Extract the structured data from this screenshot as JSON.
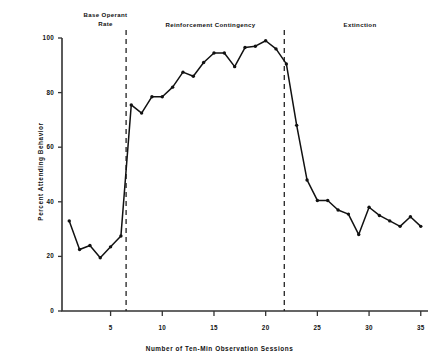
{
  "figure": {
    "background_color": "#ffffff",
    "line_color": "#111111",
    "marker_color": "#111111",
    "axis_color": "#333333"
  },
  "axes": {
    "x": {
      "title": "Number of Ten-Min Observation Sessions",
      "ticks": [
        5,
        10,
        15,
        20,
        25,
        30,
        35
      ],
      "tick_labels": [
        "5",
        "10",
        "15",
        "20",
        "25",
        "30",
        "35"
      ],
      "min": 0.3,
      "max": 35.7
    },
    "y": {
      "title": "Percent Attending Behavior",
      "ticks": [
        0,
        20,
        40,
        60,
        80,
        100
      ],
      "tick_labels": [
        "0",
        "20",
        "40",
        "60",
        "80",
        "100"
      ],
      "min": 0,
      "max": 100
    }
  },
  "phases": [
    {
      "id": "base-operant-rate",
      "label": "Base Operant\nRate",
      "start": 1,
      "end": 6.5
    },
    {
      "id": "reinforcement-contingency",
      "label": "Reinforcement  Contingency",
      "start": 6.5,
      "end": 21.8
    },
    {
      "id": "extinction",
      "label": "Extinction",
      "start": 21.8,
      "end": 35
    }
  ],
  "phase_dividers": [
    6.5,
    21.8
  ],
  "chart_data": {
    "type": "line",
    "title": "",
    "subtitle": "",
    "xlabel": "Number of Ten-Min Observation Sessions",
    "ylabel": "Percent Attending Behavior",
    "xlim": [
      0.3,
      35.7
    ],
    "ylim": [
      0,
      100
    ],
    "grid": false,
    "legend": "none",
    "x": [
      1,
      2,
      3,
      4,
      5,
      6,
      7,
      8,
      9,
      10,
      11,
      12,
      13,
      14,
      15,
      16,
      17,
      18,
      19,
      20,
      21,
      22,
      23,
      24,
      25,
      26,
      27,
      28,
      29,
      30,
      31,
      32,
      33,
      34,
      35
    ],
    "values": [
      33,
      22.5,
      24,
      19.5,
      23.5,
      27.5,
      75.5,
      72.5,
      78.5,
      78.5,
      82,
      87.5,
      86,
      91,
      94.5,
      94.5,
      89.5,
      96.5,
      97,
      99,
      96,
      90.5,
      68,
      48,
      40.5,
      40.5,
      37,
      35.5,
      28,
      38,
      35,
      33,
      31,
      34.5,
      31
    ],
    "annotations": [
      {
        "text": "Base Operant Rate",
        "x_range": [
          1,
          6.5
        ]
      },
      {
        "text": "Reinforcement  Contingency",
        "x_range": [
          6.5,
          21.8
        ]
      },
      {
        "text": "Extinction",
        "x_range": [
          21.8,
          35
        ]
      }
    ]
  }
}
